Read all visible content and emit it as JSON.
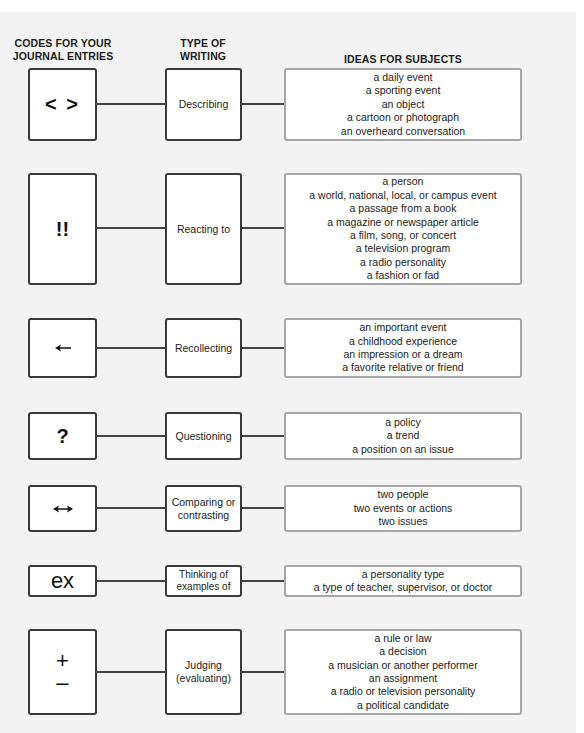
{
  "headers": {
    "codes": "CODES FOR YOUR\nJOURNAL ENTRIES",
    "codes_line1": "CODES FOR YOUR",
    "codes_line2": "JOURNAL ENTRIES",
    "type_line1": "TYPE OF",
    "type_line2": "WRITING",
    "ideas": "IDEAS FOR SUBJECTS"
  },
  "rows": [
    {
      "code": "< >",
      "code_icon": "angle-brackets",
      "type": "Describing",
      "subjects": [
        "a daily event",
        "a sporting event",
        "an object",
        "a cartoon or photograph",
        "an overheard conversation"
      ]
    },
    {
      "code": "!!",
      "code_icon": "double-exclamation",
      "type": "Reacting to",
      "subjects": [
        "a person",
        "a world, national, local, or campus event",
        "a passage from a book",
        "a magazine or newspaper article",
        "a film, song, or concert",
        "a television program",
        "a radio personality",
        "a fashion or fad"
      ]
    },
    {
      "code": "←",
      "code_icon": "left-arrow",
      "type": "Recollecting",
      "subjects": [
        "an important event",
        "a childhood experience",
        "an impression or a dream",
        "a favorite relative or friend"
      ]
    },
    {
      "code": "?",
      "code_icon": "question-mark",
      "type": "Questioning",
      "subjects": [
        "a policy",
        "a trend",
        "a position on an issue"
      ]
    },
    {
      "code": "↔",
      "code_icon": "left-right-arrow",
      "type_line1": "Comparing or",
      "type_line2": "contrasting",
      "subjects": [
        "two people",
        "two events or actions",
        "two issues"
      ]
    },
    {
      "code": "ex",
      "code_icon": "ex-text",
      "type_line1": "Thinking of",
      "type_line2": "examples of",
      "subjects": [
        "a personality type",
        "a type of teacher, supervisor, or doctor"
      ]
    },
    {
      "code_plus": "+",
      "code_minus": "–",
      "code_icon": "plus-minus",
      "type_line1": "Judging",
      "type_line2": "(evaluating)",
      "subjects": [
        "a rule or law",
        "a decision",
        "a musician or another performer",
        "an assignment",
        "a radio or television personality",
        "a political candidate"
      ]
    }
  ],
  "colors": {
    "background": "#f3f3f3",
    "code_border": "#3b3b3b",
    "subject_border": "#a7a7a7",
    "connector": "#444444"
  }
}
